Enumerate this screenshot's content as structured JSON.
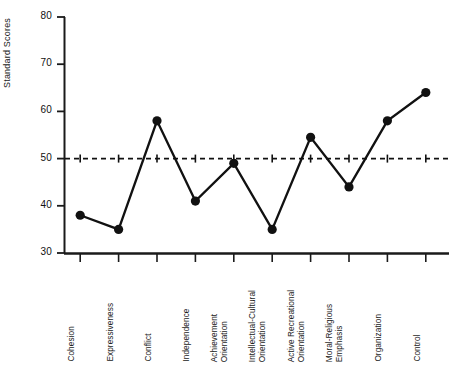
{
  "chart_data": {
    "type": "line",
    "title": "",
    "xlabel": "",
    "ylabel": "Standard Scores",
    "ylim": [
      30,
      80
    ],
    "yticks": [
      30,
      40,
      50,
      60,
      70,
      80
    ],
    "grid": false,
    "legend": null,
    "reference_line": {
      "value": 50,
      "style": "dashed"
    },
    "marker": "filled-circle",
    "line_color": "#000000",
    "categories": [
      "Cohesion",
      "Expressiveness",
      "Conflict",
      "Independence",
      "Achievement Orientation",
      "Intellectual-Cultural Orientation",
      "Active Recreational Orientation",
      "Moral-Religious Emphasis",
      "Organization",
      "Control"
    ],
    "category_lines": [
      [
        "Cohesion"
      ],
      [
        "Expressiveness"
      ],
      [
        "Conflict"
      ],
      [
        "Independence"
      ],
      [
        "Achievement",
        "Orientation"
      ],
      [
        "Intellectual-Cultural",
        "Orientation"
      ],
      [
        "Active Recreational",
        "Orientation"
      ],
      [
        "Moral-Religious",
        "Emphasis"
      ],
      [
        "Organization"
      ],
      [
        "Control"
      ]
    ],
    "values": [
      38,
      35,
      58,
      41,
      49,
      35,
      54.5,
      44,
      58,
      64
    ]
  },
  "axis": {
    "y_tick_labels": [
      "80",
      "70",
      "60",
      "50",
      "40",
      "30"
    ],
    "y_title": "Standard Scores"
  }
}
